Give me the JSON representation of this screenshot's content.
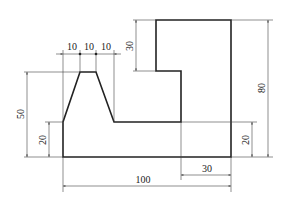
{
  "drawing": {
    "type": "orthographic-view",
    "description": "Stepped part with trapezoidal boss",
    "dimensions": {
      "overall_width": "100",
      "overall_height": "80",
      "top_step_height": "30",
      "right_step_width": "30",
      "right_base_height": "20",
      "left_base_height": "20",
      "boss_height": "50",
      "boss_offset_1": "10",
      "boss_offset_2": "10",
      "boss_offset_3": "10"
    },
    "colors": {
      "line": "#222222",
      "background": "#ffffff"
    }
  }
}
